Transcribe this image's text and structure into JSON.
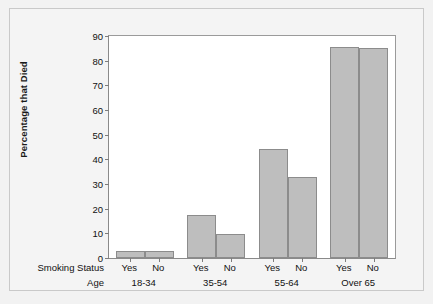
{
  "chart_data": {
    "type": "bar",
    "title": "",
    "xlabel": "",
    "ylabel": "Percentage that Died",
    "ylim": [
      0,
      90
    ],
    "yticks": [
      0,
      10,
      20,
      30,
      40,
      50,
      60,
      70,
      80,
      90
    ],
    "grid": false,
    "legend": "none",
    "row_headers": {
      "smoking_status": "Smoking Status",
      "age": "Age"
    },
    "categories": [
      "18-34",
      "35-54",
      "55-64",
      "Over 65"
    ],
    "subcategories": [
      "Yes",
      "No"
    ],
    "series": [
      {
        "name": "Yes",
        "values": [
          3.0,
          17.5,
          44.2,
          85.6
        ]
      },
      {
        "name": "No",
        "values": [
          3.0,
          9.7,
          33.0,
          85.3
        ]
      }
    ],
    "bars": [
      {
        "group": "18-34",
        "smoking": "Yes",
        "value": 3.0
      },
      {
        "group": "18-34",
        "smoking": "No",
        "value": 3.0
      },
      {
        "group": "35-54",
        "smoking": "Yes",
        "value": 17.5
      },
      {
        "group": "35-54",
        "smoking": "No",
        "value": 9.7
      },
      {
        "group": "55-64",
        "smoking": "Yes",
        "value": 44.2
      },
      {
        "group": "55-64",
        "smoking": "No",
        "value": 33.0
      },
      {
        "group": "Over 65",
        "smoking": "Yes",
        "value": 85.6
      },
      {
        "group": "Over 65",
        "smoking": "No",
        "value": 85.3
      }
    ],
    "colors": {
      "bar_fill": "#bebebe",
      "bar_border": "#8c8c8c",
      "plot_background": "#ffffff",
      "figure_background": "#f2f2f2",
      "axis": "#8a8a8a",
      "text": "#111111"
    }
  }
}
